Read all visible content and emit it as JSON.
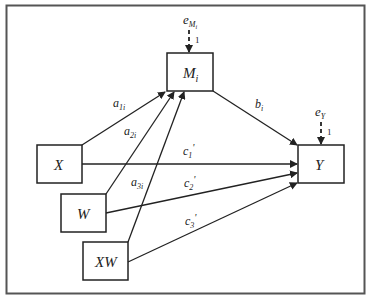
{
  "diagram": {
    "title": "",
    "type": "path-model",
    "nodes": [
      {
        "id": "M",
        "label": "M",
        "sub": "i",
        "x": 167,
        "y": 53,
        "w": 46,
        "h": 38
      },
      {
        "id": "X",
        "label": "X",
        "sub": "",
        "x": 37,
        "y": 145,
        "w": 45,
        "h": 38
      },
      {
        "id": "W",
        "label": "W",
        "sub": "",
        "x": 61,
        "y": 194,
        "w": 45,
        "h": 38
      },
      {
        "id": "XW",
        "label": "XW",
        "sub": "",
        "x": 83,
        "y": 242,
        "w": 45,
        "h": 38
      },
      {
        "id": "Y",
        "label": "Y",
        "sub": "",
        "x": 298,
        "y": 145,
        "w": 46,
        "h": 38
      }
    ],
    "edges": [
      {
        "from": "X",
        "to": "M",
        "label": "a",
        "sub": "1i"
      },
      {
        "from": "W",
        "to": "M",
        "label": "a",
        "sub": "2i"
      },
      {
        "from": "XW",
        "to": "M",
        "label": "a",
        "sub": "3i"
      },
      {
        "from": "M",
        "to": "Y",
        "label": "b",
        "sub": "i"
      },
      {
        "from": "X",
        "to": "Y",
        "label": "c",
        "sub": "1",
        "prime": "'"
      },
      {
        "from": "W",
        "to": "Y",
        "label": "c",
        "sub": "2",
        "prime": "'"
      },
      {
        "from": "XW",
        "to": "Y",
        "label": "c",
        "sub": "3",
        "prime": "'"
      }
    ],
    "errors": [
      {
        "target": "M",
        "label": "e",
        "sub": "M",
        "subsub": "i",
        "weight": "1"
      },
      {
        "target": "Y",
        "label": "e",
        "sub": "Y",
        "weight": "1"
      }
    ],
    "labels": {
      "m_main": "M",
      "m_sub": "i",
      "x": "X",
      "w": "W",
      "xw": "XW",
      "y": "Y",
      "a1": "a",
      "a1_sub": "1i",
      "a2": "a",
      "a2_sub": "2i",
      "a3": "a",
      "a3_sub": "3i",
      "b": "b",
      "b_sub": "i",
      "c1": "c",
      "c1_sub": "1",
      "c1_prime": "'",
      "c2": "c",
      "c2_sub": "2",
      "c2_prime": "'",
      "c3": "c",
      "c3_sub": "3",
      "c3_prime": "'",
      "em": "e",
      "em_sub": "M",
      "em_subsub": "i",
      "em_weight": "1",
      "ey": "e",
      "ey_sub": "Y",
      "ey_weight": "1"
    }
  }
}
